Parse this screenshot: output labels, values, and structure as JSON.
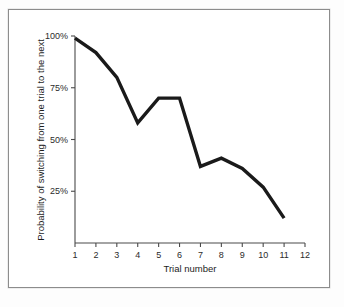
{
  "figure": {
    "background_color": "#ffffff",
    "frame_color": "#8c8c8c",
    "line_color": "#1a1a1a"
  },
  "chart_data": {
    "type": "line",
    "title": "",
    "xlabel": "Trial number",
    "ylabel": "Probability of switching from one trial to the next",
    "x": [
      1,
      2,
      3,
      4,
      5,
      6,
      7,
      8,
      9,
      10,
      11
    ],
    "values": [
      99,
      92,
      80,
      58,
      70,
      70,
      37,
      41,
      36,
      27,
      12
    ],
    "series": [
      {
        "name": "Probability of switching",
        "values": [
          99,
          92,
          80,
          58,
          70,
          70,
          37,
          41,
          36,
          27,
          12
        ]
      }
    ],
    "xlim": [
      1,
      12
    ],
    "ylim": [
      0,
      100
    ],
    "xticks": [
      1,
      2,
      3,
      4,
      5,
      6,
      7,
      8,
      9,
      10,
      11,
      12
    ],
    "xtick_labels": [
      "1",
      "2",
      "3",
      "4",
      "5",
      "6",
      "7",
      "8",
      "9",
      "10",
      "11",
      "12"
    ],
    "yticks": [
      25,
      50,
      75,
      100
    ],
    "ytick_labels": [
      "25%",
      "50%",
      "75%",
      "100%"
    ],
    "grid": false,
    "legend": null,
    "legend_position": "none",
    "annotations": []
  }
}
